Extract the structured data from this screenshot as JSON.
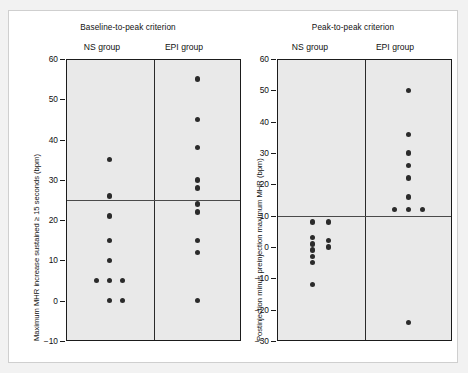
{
  "figure": {
    "background": "#f2f2f2",
    "panel_background": "#e9e9e9",
    "frame_background": "#ffffff",
    "dot_color": "#2b2b2b",
    "axis_color": "#1b1b1b",
    "ref_line_color": "#4a4a4a"
  },
  "chart_data": [
    {
      "type": "scatter",
      "title": "Baseline-to-peak criterion",
      "xlabel": "",
      "ylabel": "Maximum MHR increase sustained ≥ 15 seconds (bpm)",
      "ylim": [
        -10,
        60
      ],
      "yticks": [
        -10,
        0,
        10,
        20,
        30,
        40,
        50,
        60
      ],
      "ytick_labels": [
        "-10",
        "0",
        "10",
        "20",
        "30",
        "40",
        "50",
        "60"
      ],
      "grid": false,
      "legend": "none",
      "reference_line": 25,
      "categories": [
        "NS group",
        "EPI group"
      ],
      "series": [
        {
          "name": "NS group",
          "values": [
            35,
            26,
            21,
            15,
            10,
            5,
            5,
            5,
            0,
            0
          ],
          "points": [
            {
              "value": 35,
              "offset": 0
            },
            {
              "value": 26,
              "offset": 0
            },
            {
              "value": 21,
              "offset": 0
            },
            {
              "value": 15,
              "offset": 0
            },
            {
              "value": 10,
              "offset": 0
            },
            {
              "value": 5,
              "offset": -13
            },
            {
              "value": 5,
              "offset": 0
            },
            {
              "value": 5,
              "offset": 13
            },
            {
              "value": 0,
              "offset": 0
            },
            {
              "value": 0,
              "offset": 13
            }
          ]
        },
        {
          "name": "EPI group",
          "values": [
            55,
            45,
            38,
            30,
            28,
            24,
            22,
            15,
            12,
            0
          ],
          "points": [
            {
              "value": 55,
              "offset": 0
            },
            {
              "value": 45,
              "offset": 0
            },
            {
              "value": 38,
              "offset": 0
            },
            {
              "value": 30,
              "offset": 0
            },
            {
              "value": 28,
              "offset": 0
            },
            {
              "value": 24,
              "offset": 0
            },
            {
              "value": 22,
              "offset": 0
            },
            {
              "value": 15,
              "offset": 0
            },
            {
              "value": 12,
              "offset": 0
            },
            {
              "value": 0,
              "offset": 0
            }
          ]
        }
      ]
    },
    {
      "type": "scatter",
      "title": "Peak-to-peak criterion",
      "xlabel": "",
      "ylabel": "Postinjection minus preinjection maximum MHR (bpm)",
      "ylim": [
        -30,
        60
      ],
      "yticks": [
        -30,
        -20,
        -10,
        0,
        10,
        20,
        30,
        40,
        50,
        60
      ],
      "ytick_labels": [
        "-30",
        "-20",
        "-10",
        "0",
        "10",
        "20",
        "30",
        "40",
        "50",
        "60"
      ],
      "grid": false,
      "legend": "none",
      "reference_line": 10,
      "categories": [
        "NS group",
        "EPI group"
      ],
      "series": [
        {
          "name": "NS group",
          "values": [
            8,
            8,
            3,
            2,
            1,
            0,
            0,
            -3,
            -5,
            -12
          ],
          "points": [
            {
              "value": 8,
              "offset": -8
            },
            {
              "value": 8,
              "offset": 8
            },
            {
              "value": 3,
              "offset": -8
            },
            {
              "value": 2,
              "offset": 8
            },
            {
              "value": 1,
              "offset": -8
            },
            {
              "value": 0,
              "offset": 8
            },
            {
              "value": -1,
              "offset": -8
            },
            {
              "value": -3,
              "offset": -8
            },
            {
              "value": -5,
              "offset": -8
            },
            {
              "value": -12,
              "offset": -8
            }
          ]
        },
        {
          "name": "EPI group",
          "values": [
            50,
            36,
            30,
            26,
            22,
            16,
            12,
            12,
            12,
            -24
          ],
          "points": [
            {
              "value": 50,
              "offset": 0
            },
            {
              "value": 36,
              "offset": 0
            },
            {
              "value": 30,
              "offset": 0
            },
            {
              "value": 26,
              "offset": 0
            },
            {
              "value": 22,
              "offset": 0
            },
            {
              "value": 16,
              "offset": 0
            },
            {
              "value": 12,
              "offset": -14
            },
            {
              "value": 12,
              "offset": 0
            },
            {
              "value": 12,
              "offset": 14
            },
            {
              "value": -24,
              "offset": 0
            }
          ]
        }
      ]
    }
  ]
}
